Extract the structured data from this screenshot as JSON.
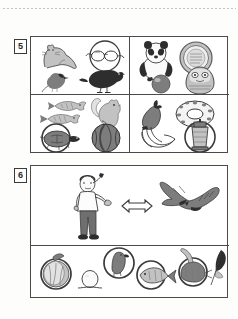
{
  "page": {
    "type": "worksheet-scan",
    "background_color": "#fdfdfc",
    "ink_color": "#2e2e2e",
    "frame_color": "#4a4a4a"
  },
  "decorations": {
    "dotted_rule": "dotted-rule-top"
  },
  "exercises": [
    {
      "number": "5",
      "label_name": "exercise-number-5",
      "layout": "2x2-grid",
      "cells": [
        {
          "position": "top-left",
          "name": "cell-5-top-left",
          "items": [
            {
              "name": "cat-illustration",
              "icon": "cat-icon",
              "label": "cat"
            },
            {
              "name": "glasses-circle-illustration",
              "icon": "glasses-circled-icon",
              "label": "glasses"
            },
            {
              "name": "sparrow-illustration",
              "icon": "sparrow-icon",
              "label": "sparrow"
            },
            {
              "name": "crow-illustration",
              "icon": "crow-icon",
              "label": "crow"
            }
          ]
        },
        {
          "position": "top-right",
          "name": "cell-5-top-right",
          "items": [
            {
              "name": "panda-illustration",
              "icon": "panda-icon",
              "label": "panda"
            },
            {
              "name": "medal-illustration",
              "icon": "medal-circled-icon",
              "label": "medal"
            },
            {
              "name": "ball-illustration",
              "icon": "ball-icon",
              "label": "ball"
            },
            {
              "name": "daruma-illustration",
              "icon": "daruma-icon",
              "label": "daruma doll"
            }
          ]
        },
        {
          "position": "bottom-left",
          "name": "cell-5-bottom-left",
          "items": [
            {
              "name": "fish-upper-illustration",
              "icon": "fish-icon",
              "label": "fish"
            },
            {
              "name": "fish-lower-illustration",
              "icon": "fish-icon",
              "label": "fish"
            },
            {
              "name": "squirrel-illustration",
              "icon": "squirrel-icon",
              "label": "squirrel"
            },
            {
              "name": "turtle-circled-illustration",
              "icon": "turtle-circled-icon",
              "label": "turtle"
            },
            {
              "name": "watermelon-illustration",
              "icon": "watermelon-icon",
              "label": "watermelon"
            }
          ]
        },
        {
          "position": "bottom-right",
          "name": "cell-5-bottom-right",
          "items": [
            {
              "name": "eggplant-illustration",
              "icon": "eggplant-icon",
              "label": "eggplant"
            },
            {
              "name": "doughnut-illustration",
              "icon": "doughnut-icon",
              "label": "doughnut"
            },
            {
              "name": "bananas-illustration",
              "icon": "bananas-icon",
              "label": "bananas"
            },
            {
              "name": "lantern-circled-illustration",
              "icon": "lantern-circled-icon",
              "label": "lantern"
            }
          ]
        }
      ]
    },
    {
      "number": "6",
      "label_name": "exercise-number-6",
      "layout": "2-row-stack",
      "cells": [
        {
          "position": "top",
          "name": "cell-6-top",
          "items": [
            {
              "name": "person-pointing-illustration",
              "icon": "person-icon",
              "label": "person pointing"
            },
            {
              "name": "double-arrow-symbol",
              "icon": "double-arrow-icon",
              "label": "double arrow"
            },
            {
              "name": "eagle-illustration",
              "icon": "eagle-icon",
              "label": "eagle"
            }
          ]
        },
        {
          "position": "bottom",
          "name": "cell-6-bottom",
          "items": [
            {
              "name": "cabbage-circled-illustration",
              "icon": "cabbage-circled-icon",
              "label": "cabbage"
            },
            {
              "name": "egg-illustration",
              "icon": "egg-icon",
              "label": "egg"
            },
            {
              "name": "bird-circled-illustration",
              "icon": "bird-circled-icon",
              "label": "bird"
            },
            {
              "name": "fish-circled-illustration",
              "icon": "fish-circled-icon",
              "label": "fish"
            },
            {
              "name": "shrimp-circled-illustration",
              "icon": "shrimp-circled-icon",
              "label": "shrimp"
            },
            {
              "name": "feather-illustration",
              "icon": "feather-icon",
              "label": "feather"
            }
          ]
        }
      ]
    }
  ]
}
